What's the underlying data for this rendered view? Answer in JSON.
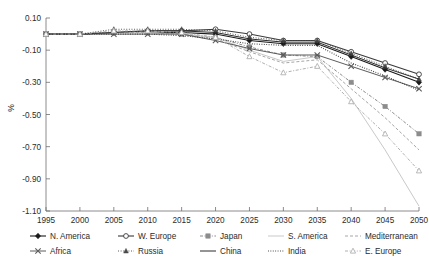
{
  "chart_data": {
    "type": "line",
    "title": "",
    "xlabel": "",
    "ylabel": "%",
    "x": [
      1995,
      2000,
      2005,
      2010,
      2015,
      2020,
      2025,
      2030,
      2035,
      2040,
      2045,
      2050
    ],
    "xtick_labels": [
      "1995",
      "2000",
      "2005",
      "2010",
      "2015",
      "2020",
      "2025",
      "2030",
      "2035",
      "2040",
      "2045",
      "2050"
    ],
    "ytick_labels": [
      "0.10",
      "-0.10",
      "-0.30",
      "-0.50",
      "-0.70",
      "-0.90",
      "-1.10"
    ],
    "ytick_values": [
      0.1,
      -0.1,
      -0.3,
      -0.5,
      -0.7,
      -0.9,
      -1.1
    ],
    "xlim": [
      1995,
      2050
    ],
    "ylim": [
      -1.1,
      0.1
    ],
    "grid": false,
    "legend_position": "below",
    "series": [
      {
        "name": "N. America",
        "marker": "filled-diamond",
        "dash": "none",
        "color": "#1a1a1a",
        "width": 1.1,
        "values": [
          0.0,
          0.0,
          0.01,
          0.01,
          0.01,
          0.0,
          -0.04,
          -0.06,
          -0.06,
          -0.14,
          -0.22,
          -0.3
        ]
      },
      {
        "name": "W. Europe",
        "marker": "open-circle",
        "dash": "none",
        "color": "#3a3a3a",
        "width": 1.1,
        "values": [
          0.0,
          0.0,
          0.01,
          0.02,
          0.02,
          0.03,
          0.0,
          -0.04,
          -0.04,
          -0.11,
          -0.18,
          -0.25
        ]
      },
      {
        "name": "Japan",
        "marker": "filled-square",
        "dash": "dash-dot",
        "color": "#8c8c8c",
        "width": 1.0,
        "values": [
          0.0,
          0.0,
          0.01,
          0.01,
          0.0,
          -0.02,
          -0.08,
          -0.13,
          -0.14,
          -0.3,
          -0.45,
          -0.62
        ]
      },
      {
        "name": "S. America",
        "marker": "none",
        "dash": "none",
        "color": "#c9c9c9",
        "width": 1.0,
        "values": [
          0.0,
          0.0,
          0.01,
          0.01,
          0.0,
          -0.02,
          -0.1,
          -0.17,
          -0.14,
          -0.4,
          -0.72,
          -1.07
        ]
      },
      {
        "name": "Mediterranean",
        "marker": "none",
        "dash": "sparse-dash",
        "color": "#a6a6a6",
        "width": 1.0,
        "values": [
          0.0,
          0.0,
          0.01,
          0.01,
          0.0,
          -0.03,
          -0.11,
          -0.18,
          -0.16,
          -0.34,
          -0.52,
          -0.72
        ]
      },
      {
        "name": "Africa",
        "marker": "cross-x",
        "dash": "none",
        "color": "#5c5c5c",
        "width": 1.0,
        "values": [
          0.0,
          0.0,
          0.0,
          0.0,
          0.0,
          -0.04,
          -0.09,
          -0.13,
          -0.13,
          -0.2,
          -0.27,
          -0.34
        ]
      },
      {
        "name": "Russia",
        "marker": "small-triangle",
        "dash": "dotted",
        "color": "#4a4a4a",
        "width": 0.9,
        "values": [
          0.0,
          0.0,
          0.03,
          0.03,
          0.03,
          0.02,
          -0.02,
          -0.04,
          -0.04,
          -0.12,
          -0.2,
          -0.28
        ]
      },
      {
        "name": "China",
        "marker": "none",
        "dash": "none",
        "color": "#2b2b2b",
        "width": 1.0,
        "values": [
          0.0,
          0.0,
          0.01,
          0.02,
          0.02,
          0.01,
          -0.03,
          -0.05,
          -0.05,
          -0.13,
          -0.21,
          -0.28
        ]
      },
      {
        "name": "India",
        "marker": "none",
        "dash": "fine-dot",
        "color": "#3d3d3d",
        "width": 1.1,
        "values": [
          0.0,
          0.0,
          0.0,
          0.0,
          -0.01,
          -0.03,
          -0.06,
          -0.07,
          -0.07,
          -0.18,
          -0.26,
          -0.35
        ]
      },
      {
        "name": "E. Europe",
        "marker": "open-triangle",
        "dash": "dash-dot",
        "color": "#b0b0b0",
        "width": 1.0,
        "values": [
          0.0,
          0.0,
          0.02,
          0.02,
          0.01,
          -0.02,
          -0.14,
          -0.24,
          -0.2,
          -0.42,
          -0.62,
          -0.85
        ]
      }
    ]
  },
  "legend": {
    "row1": [
      "N. America",
      "W. Europe",
      "Japan",
      "S. America",
      "Mediterranean"
    ],
    "row2": [
      "Africa",
      "Russia",
      "China",
      "India",
      "E. Europe"
    ]
  }
}
